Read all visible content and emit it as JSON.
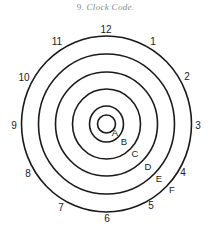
{
  "caption": {
    "number": "9.",
    "title": "Clock Code."
  },
  "diagram": {
    "center": [
      106.5,
      124
    ],
    "rings": [
      {
        "letter": "A",
        "rx": 9,
        "ry": 9,
        "label_pos": [
          115,
          132
        ]
      },
      {
        "letter": "B",
        "rx": 17,
        "ry": 18,
        "label_pos": [
          124,
          141
        ]
      },
      {
        "letter": "C",
        "rx": 34,
        "ry": 35,
        "label_pos": [
          135,
          153
        ]
      },
      {
        "letter": "D",
        "rx": 51,
        "ry": 52,
        "label_pos": [
          148,
          166
        ]
      },
      {
        "letter": "E",
        "rx": 68,
        "ry": 70,
        "label_pos": [
          159,
          178
        ]
      },
      {
        "letter": "F",
        "rx": 85,
        "ry": 88,
        "label_pos": [
          172,
          189
        ]
      }
    ],
    "clock_numbers": [
      {
        "n": "12",
        "pos": [
          106,
          29
        ]
      },
      {
        "n": "1",
        "pos": [
          153,
          41
        ]
      },
      {
        "n": "2",
        "pos": [
          187,
          76
        ]
      },
      {
        "n": "3",
        "pos": [
          198,
          125
        ]
      },
      {
        "n": "4",
        "pos": [
          183,
          172
        ]
      },
      {
        "n": "5",
        "pos": [
          151,
          205
        ]
      },
      {
        "n": "6",
        "pos": [
          107,
          218
        ]
      },
      {
        "n": "7",
        "pos": [
          61,
          207
        ]
      },
      {
        "n": "8",
        "pos": [
          28,
          173
        ]
      },
      {
        "n": "9",
        "pos": [
          14,
          125
        ]
      },
      {
        "n": "10",
        "pos": [
          24,
          77
        ]
      },
      {
        "n": "11",
        "pos": [
          57,
          41
        ]
      }
    ],
    "stroke_color": "#1a1a1a",
    "text_color": "#222222"
  }
}
